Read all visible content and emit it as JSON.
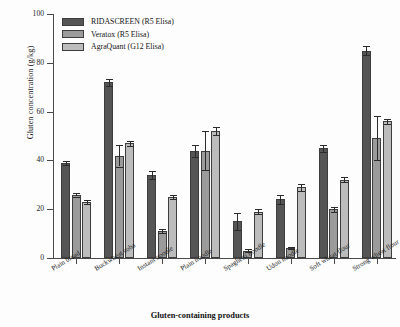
{
  "chart_data": {
    "type": "bar",
    "title": "",
    "xlabel": "Gluten-containing products",
    "ylabel": "Gluten concentration (g/kg)",
    "ylim": [
      0,
      100
    ],
    "yticks": [
      0,
      20,
      40,
      60,
      80,
      100
    ],
    "grid": false,
    "legend_position": "top-left",
    "categories": [
      "Plain bread",
      "Buckwheat soba",
      "Instant noodle",
      "Plain noodle",
      "Spaghetti noodle",
      "Udon noodle",
      "Soft wheat flour",
      "Strong wheat flour"
    ],
    "series": [
      {
        "name": "RIDASCREEN (R5 Elisa)",
        "color": "#555555",
        "values": [
          39,
          72,
          34,
          44,
          15,
          24,
          45,
          85
        ],
        "errors": [
          0.8,
          1.5,
          1.5,
          2.5,
          3.5,
          2.0,
          1.5,
          2.0
        ]
      },
      {
        "name": "Veratox (R5 Elisa)",
        "color": "#9b9b9b",
        "values": [
          26,
          42,
          11,
          44,
          3,
          4,
          20,
          49
        ],
        "errors": [
          0.8,
          4.5,
          0.8,
          8.0,
          0.5,
          0.5,
          1.0,
          9.0
        ]
      },
      {
        "name": "AgraQuant (G12 Elisa)",
        "color": "#bcbcbc",
        "values": [
          23,
          47,
          25,
          52,
          19,
          29,
          32,
          56
        ],
        "errors": [
          0.8,
          1.0,
          1.0,
          1.5,
          1.0,
          1.5,
          1.0,
          1.0
        ]
      }
    ]
  }
}
